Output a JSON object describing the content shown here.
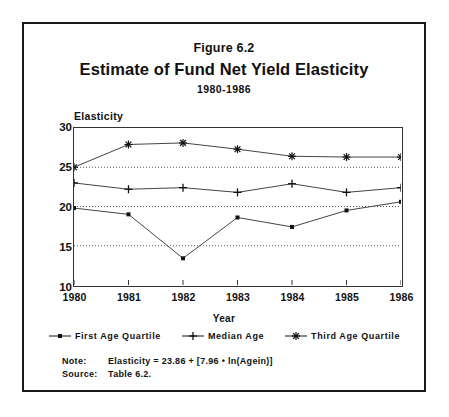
{
  "figure": {
    "number": "Figure 6.2",
    "title": "Estimate of Fund Net Yield Elasticity",
    "period": "1980-1986"
  },
  "notes": {
    "note_key": "Note:",
    "note_value": "Elasticity = 23.86 + [7.96 • ln(Agein)]",
    "source_key": "Source:",
    "source_value": "Table 6.2."
  },
  "legend": [
    {
      "label": "First Age Quartile",
      "marker": "square-marker-icon",
      "color": "#333333"
    },
    {
      "label": "Median Age",
      "marker": "plus-marker-icon",
      "color": "#333333"
    },
    {
      "label": "Third Age Quartile",
      "marker": "asterisk-marker-icon",
      "color": "#333333"
    }
  ],
  "chart_data": {
    "type": "line",
    "title": "Estimate of Fund Net Yield Elasticity",
    "subtitle": "1980-1986",
    "xlabel": "Year",
    "ylabel": "Elasticity",
    "categories": [
      "1980",
      "1981",
      "1982",
      "1983",
      "1984",
      "1985",
      "1986"
    ],
    "x": [
      1980,
      1981,
      1982,
      1983,
      1984,
      1985,
      1986
    ],
    "ylim": [
      10,
      30
    ],
    "yticks": [
      10,
      15,
      20,
      25,
      30
    ],
    "xlim": [
      1980,
      1986
    ],
    "grid": "horizontal-dotted",
    "legend_position": "bottom",
    "series": [
      {
        "name": "First Age Quartile",
        "marker": "square",
        "values": [
          19.8,
          19.0,
          13.4,
          18.6,
          17.4,
          19.5,
          20.6
        ]
      },
      {
        "name": "Median Age",
        "marker": "plus",
        "values": [
          23.0,
          22.2,
          22.4,
          21.8,
          22.9,
          21.8,
          22.4
        ]
      },
      {
        "name": "Third Age Quartile",
        "marker": "asterisk",
        "values": [
          25.0,
          27.9,
          28.1,
          27.3,
          26.4,
          26.3,
          26.3
        ]
      }
    ]
  }
}
